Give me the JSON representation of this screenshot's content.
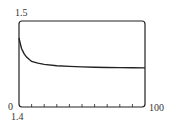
{
  "chart_data": {
    "type": "line",
    "title": "",
    "xlabel": "",
    "ylabel": "",
    "xlim": [
      0,
      100
    ],
    "ylim": [
      1.4,
      1.5
    ],
    "x_tick_labels": [
      "0",
      "100"
    ],
    "y_tick_labels": [
      "1.4",
      "1.5"
    ],
    "x_ticks": [
      0,
      10,
      20,
      30,
      40,
      50,
      60,
      70,
      80,
      90,
      100
    ],
    "grid": false,
    "legend": null,
    "series": [
      {
        "name": "curve",
        "x": [
          0,
          1,
          2,
          4,
          6,
          10,
          15,
          20,
          30,
          40,
          50,
          60,
          70,
          80,
          90,
          100
        ],
        "y": [
          1.48,
          1.474,
          1.468,
          1.462,
          1.458,
          1.453,
          1.451,
          1.4495,
          1.448,
          1.4472,
          1.4467,
          1.4463,
          1.446,
          1.4458,
          1.4456,
          1.4455
        ]
      }
    ]
  },
  "labels": {
    "y_top": "1.5",
    "y_bottom": "1.4",
    "x_left": "0",
    "x_right": "100"
  }
}
